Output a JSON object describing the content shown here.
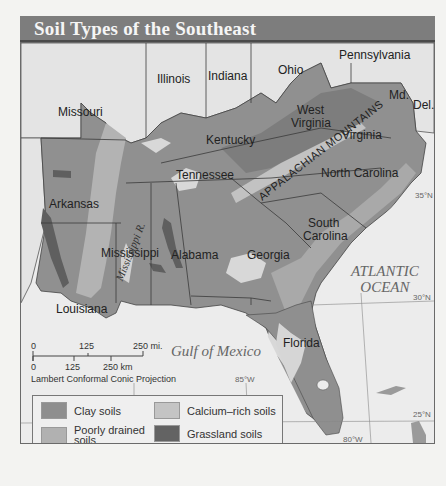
{
  "title": "Soil Types of the Southeast",
  "states": [
    {
      "name": "Missouri",
      "x": 37,
      "y": 70
    },
    {
      "name": "Illinois",
      "x": 136,
      "y": 37
    },
    {
      "name": "Indiana",
      "x": 187,
      "y": 34
    },
    {
      "name": "Ohio",
      "x": 257,
      "y": 28
    },
    {
      "name": "Pennsylvania",
      "x": 338,
      "y": 12
    },
    {
      "name": "Md.",
      "x": 387,
      "y": 52
    },
    {
      "name": "Del.",
      "x": 411,
      "y": 62
    },
    {
      "name": "West",
      "x": 276,
      "y": 56
    },
    {
      "name": "Virginia",
      "x": 270,
      "y": 69
    },
    {
      "name": "Kentucky",
      "x": 205,
      "y": 86
    },
    {
      "name": "Virginia",
      "x": 320,
      "y": 84
    },
    {
      "name": "Tennessee",
      "x": 175,
      "y": 122
    },
    {
      "name": "North Carolina",
      "x": 300,
      "y": 129
    },
    {
      "name": "Arkansas",
      "x": 27,
      "y": 153
    },
    {
      "name": "South",
      "x": 287,
      "y": 170
    },
    {
      "name": "Carolina",
      "x": 282,
      "y": 183
    },
    {
      "name": "Mississippi",
      "x": 80,
      "y": 201
    },
    {
      "name": "Alabama",
      "x": 150,
      "y": 203
    },
    {
      "name": "Georgia",
      "x": 226,
      "y": 205
    },
    {
      "name": "Louisiana",
      "x": 35,
      "y": 249
    },
    {
      "name": "Florida",
      "x": 262,
      "y": 292
    }
  ],
  "water_labels": {
    "atlantic_line1": "ATLANTIC",
    "atlantic_line2": "OCEAN",
    "gulf": "Gulf of Mexico",
    "river": "Mississippi R.",
    "mountains": "APPALACHIAN MOUNTAINS"
  },
  "grid_labels": {
    "lat35": "35°N",
    "lat30": "30°N",
    "lat25": "25°N",
    "lon85": "85°W",
    "lon80": "80°W"
  },
  "scale_bar": {
    "mi_ticks": [
      "0",
      "125",
      "250 mi."
    ],
    "km_ticks": [
      "0",
      "125",
      "250 km"
    ],
    "projection": "Lambert Conformal Conic Projection"
  },
  "legend": {
    "items": [
      {
        "label": "Clay soils",
        "color": "#8e8e8e"
      },
      {
        "label": "Poorly drained soils",
        "color": "#b1b1b1"
      },
      {
        "label": "Upland soils",
        "color": "#8a8a8a"
      },
      {
        "label": "Calcium–rich soils",
        "color": "#c4c4c4"
      },
      {
        "label": "Grassland soils",
        "color": "#636363"
      },
      {
        "label": "Sandy soils",
        "color": "#d8d8d8"
      }
    ]
  },
  "colors": {
    "title_bar": "#7d7d7d",
    "outside_land": "#e6e6e6",
    "water": "#ececec"
  }
}
